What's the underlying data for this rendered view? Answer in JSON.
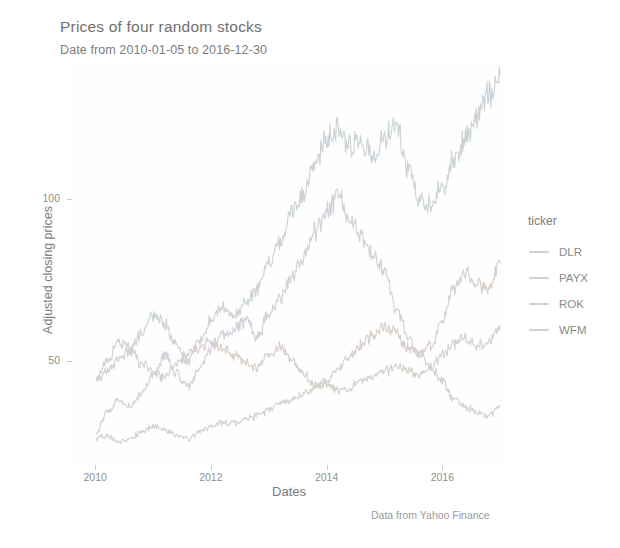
{
  "title": "Prices of four random stocks",
  "subtitle": "Date from 2010-01-05 to 2016-12-30",
  "caption": "Data from Yahoo Finance",
  "legend": {
    "title": "ticker",
    "items": [
      {
        "label": "DLR",
        "color": "#d8cfcb"
      },
      {
        "label": "PAYX",
        "color": "#cfd5cc"
      },
      {
        "label": "ROK",
        "color": "#ccd3d6"
      },
      {
        "label": "WFM",
        "color": "#d4cfd8"
      }
    ]
  },
  "chart_data": {
    "type": "line",
    "title": "Prices of four random stocks",
    "subtitle": "Date from 2010-01-05 to 2016-12-30",
    "caption": "Data from Yahoo Finance",
    "xlabel": "Dates",
    "ylabel": "Adjusted closing prices",
    "legend_title": "ticker",
    "legend_position": "right",
    "grid": false,
    "xlim": [
      2009.6,
      2017.1
    ],
    "ylim": [
      18,
      142
    ],
    "xticks": [
      2010,
      2012,
      2014,
      2016
    ],
    "xtick_labels": [
      "2010",
      "2012",
      "2014",
      "2016"
    ],
    "yticks": [
      50,
      100
    ],
    "ytick_labels": [
      "50",
      "100"
    ],
    "x": [
      2010.02,
      2010.2,
      2010.4,
      2010.6,
      2010.8,
      2011.0,
      2011.2,
      2011.4,
      2011.6,
      2011.8,
      2012.0,
      2012.2,
      2012.4,
      2012.6,
      2012.8,
      2013.0,
      2013.2,
      2013.4,
      2013.6,
      2013.8,
      2014.0,
      2014.2,
      2014.4,
      2014.6,
      2014.8,
      2015.0,
      2015.2,
      2015.4,
      2015.6,
      2015.8,
      2016.0,
      2016.2,
      2016.4,
      2016.6,
      2016.8,
      2017.0
    ],
    "series": [
      {
        "name": "DLR",
        "color": "#d8cfcb",
        "values": [
          44,
          47,
          50,
          53,
          49,
          47,
          45,
          49,
          52,
          54,
          56,
          54,
          52,
          50,
          48,
          52,
          55,
          50,
          46,
          42,
          44,
          48,
          52,
          55,
          58,
          61,
          59,
          54,
          52,
          55,
          62,
          72,
          78,
          74,
          72,
          80
        ]
      },
      {
        "name": "PAYX",
        "color": "#cfd5cc",
        "values": [
          26,
          27,
          25,
          26,
          28,
          30,
          29,
          27,
          26,
          28,
          30,
          31,
          31,
          32,
          33,
          35,
          37,
          38,
          40,
          42,
          43,
          41,
          42,
          44,
          45,
          47,
          48,
          47,
          45,
          49,
          52,
          55,
          57,
          55,
          56,
          61
        ]
      },
      {
        "name": "ROK",
        "color": "#ccd3d6",
        "values": [
          44,
          50,
          56,
          54,
          58,
          64,
          62,
          55,
          50,
          56,
          62,
          66,
          64,
          68,
          72,
          80,
          88,
          95,
          102,
          112,
          118,
          121,
          116,
          118,
          113,
          118,
          122,
          110,
          100,
          98,
          104,
          112,
          118,
          125,
          132,
          138
        ]
      },
      {
        "name": "WFM",
        "color": "#d4cfd8",
        "values": [
          28,
          34,
          38,
          36,
          40,
          46,
          52,
          46,
          42,
          48,
          54,
          58,
          60,
          62,
          58,
          64,
          70,
          76,
          82,
          90,
          96,
          100,
          94,
          88,
          82,
          78,
          66,
          58,
          52,
          48,
          44,
          38,
          36,
          34,
          33,
          36
        ]
      }
    ]
  }
}
